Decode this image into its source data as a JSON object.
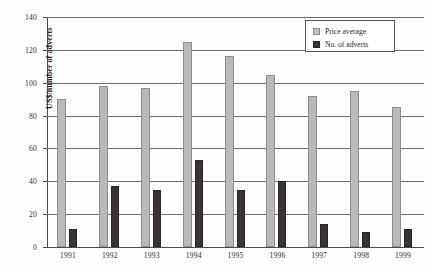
{
  "chart_data": {
    "type": "bar",
    "title": "",
    "xlabel": "",
    "ylabel": "US$/number of adverts",
    "ylim": [
      0,
      140
    ],
    "yticks": [
      0,
      20,
      40,
      60,
      80,
      100,
      120,
      140
    ],
    "grid": true,
    "legend_position": "top-right",
    "categories": [
      "1991",
      "1992",
      "1993",
      "1994",
      "1995",
      "1996",
      "1997",
      "1998",
      "1999"
    ],
    "series": [
      {
        "name": "Price average",
        "color": "#b9b9b9",
        "values": [
          90,
          98,
          96.5,
          125,
          116.5,
          105,
          92,
          95,
          85.5
        ]
      },
      {
        "name": "No. of adverts",
        "color": "#3a3332",
        "values": [
          11,
          37,
          34.5,
          53,
          35,
          40,
          14,
          9,
          11
        ]
      }
    ]
  },
  "legend": {
    "items": [
      {
        "label": "Price average"
      },
      {
        "label": "No. of adverts"
      }
    ]
  }
}
